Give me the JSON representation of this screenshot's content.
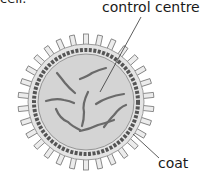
{
  "diagram": {
    "clipped_text": "cell.",
    "labels": {
      "control_centre": "control centre",
      "coat": "coat"
    },
    "colors": {
      "interior": "#d4d4d4",
      "coat_ring": "#555555",
      "spikes": "#e8e8e8",
      "genetic_material": "#6a6a6a",
      "leader_line": "#333333"
    }
  }
}
